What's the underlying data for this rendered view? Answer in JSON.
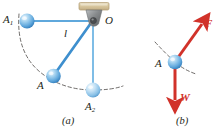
{
  "figure": {
    "panels": [
      {
        "id": "a",
        "caption": "(a)",
        "name": "pendulum-swing-diagram",
        "labels": {
          "pivot": "O",
          "bob_left": "A",
          "bob_left_sub": "1",
          "bob_mid": "A",
          "bob_bottom": "A",
          "bob_bottom_sub": "2",
          "length": "l"
        }
      },
      {
        "id": "b",
        "caption": "(b)",
        "name": "free-body-diagram",
        "labels": {
          "bob": "A",
          "tension_force": "F",
          "weight_force": "W"
        }
      }
    ]
  },
  "colors": {
    "sphere_light": "#cfe6f7",
    "sphere_mid": "#6ab0e0",
    "sphere_dark": "#2f7fc1",
    "rod": "#5fa8dc",
    "rod_thick": "#3e8fce",
    "bracket_fill": "#d9c9a3",
    "bracket_edge": "#b8a47c",
    "pivot_body": "#8a8d8f",
    "force_red": "#d1322a",
    "arc_dash": "#55514f",
    "text": "#231f20"
  },
  "geometry": {
    "pivot": {
      "x": 93,
      "y": 21
    },
    "bob_A1": {
      "x": 27,
      "y": 21
    },
    "bob_A": {
      "x": 53,
      "y": 76
    },
    "bob_A2": {
      "x": 93,
      "y": 90
    },
    "bob_b": {
      "x": 175,
      "y": 62
    },
    "force_F_tip": {
      "x": 203,
      "y": 22
    },
    "force_W_tip": {
      "x": 175,
      "y": 104
    }
  }
}
